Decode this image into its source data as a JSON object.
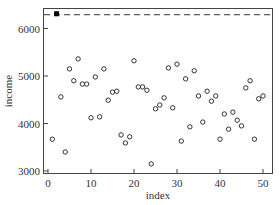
{
  "chart_data": {
    "type": "scatter",
    "title": "",
    "xlabel": "index",
    "ylabel": "income",
    "xlim": [
      -1,
      52.5
    ],
    "ylim": [
      2970,
      6440
    ],
    "xticks": [
      0,
      10,
      20,
      30,
      40,
      50
    ],
    "yticks": [
      3000,
      4000,
      5000,
      6000
    ],
    "grid": false,
    "legend": null,
    "reference_line": {
      "y": 6290,
      "style": "dashed",
      "color": "#333333"
    },
    "highlight": {
      "index": 2,
      "income": 6310,
      "marker": "filled-square",
      "color": "#000000"
    },
    "series": [
      {
        "name": "income",
        "marker": "open-circle",
        "color": "#333333",
        "x": [
          1,
          2,
          3,
          4,
          5,
          6,
          7,
          8,
          9,
          10,
          11,
          12,
          13,
          14,
          15,
          16,
          17,
          18,
          19,
          20,
          21,
          22,
          23,
          24,
          25,
          26,
          27,
          28,
          29,
          30,
          31,
          32,
          33,
          34,
          35,
          36,
          37,
          38,
          39,
          40,
          41,
          42,
          43,
          44,
          45,
          46,
          47,
          48,
          49,
          50
        ],
        "y": [
          3670,
          6310,
          4560,
          3400,
          5150,
          4900,
          5360,
          4830,
          4830,
          4120,
          4980,
          4140,
          5150,
          4490,
          4660,
          4680,
          3760,
          3590,
          3720,
          5320,
          4770,
          4770,
          4700,
          3150,
          4310,
          4390,
          4540,
          5170,
          4330,
          5250,
          3630,
          4940,
          3930,
          5110,
          4580,
          4030,
          4680,
          4470,
          4580,
          3670,
          4200,
          3880,
          4240,
          4070,
          3950,
          4750,
          4900,
          3670,
          4520,
          4580
        ]
      }
    ]
  },
  "labels": {
    "x_axis": "index",
    "y_axis": "income",
    "x_ticks": [
      "0",
      "10",
      "20",
      "30",
      "40",
      "50"
    ],
    "y_ticks": [
      "3000",
      "4000",
      "5000",
      "6000"
    ]
  }
}
